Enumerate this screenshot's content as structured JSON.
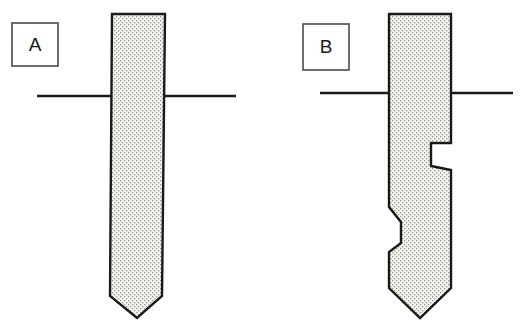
{
  "figure": {
    "background_color": "#ffffff",
    "line_color": "#1a1a1a",
    "fill_color": "#f4f4f0",
    "stipple_dot_color": "#9a9a92",
    "width": 524,
    "height": 324
  },
  "panels": [
    {
      "id": "A",
      "label": "A",
      "label_box": {
        "x": 12,
        "y": 23,
        "width": 46,
        "height": 43
      },
      "description": "Smooth tapered shaft with chamfered tip",
      "ground_line": {
        "x1": 37,
        "x2": 236,
        "y": 96
      },
      "shaft": {
        "top_y": 14,
        "top_left_x": 108,
        "top_right_x": 165,
        "tip_apex_x": 137,
        "tip_apex_y": 318,
        "chamfer_start_y": 296,
        "outline_points": "112,14 165,14 162,296 137,318 110,296"
      }
    },
    {
      "id": "B",
      "label": "B",
      "label_box": {
        "x": 303,
        "y": 24,
        "width": 46,
        "height": 46
      },
      "description": "Stepped shaft with right-side notch and left-side shoulder, chamfered tip",
      "ground_line": {
        "x1": 320,
        "x2": 513,
        "y": 93
      },
      "shaft": {
        "top_y": 14,
        "top_left_x": 389,
        "top_right_x": 451,
        "tip_apex_x": 420,
        "tip_apex_y": 318,
        "chamfer_start_y": 288,
        "right_notch": {
          "inset_x": 431,
          "start_y": 143,
          "end_y": 168
        },
        "left_notch": {
          "outset_x": 401,
          "start_y": 207,
          "flat_top_y": 222,
          "flat_bottom_y": 243,
          "end_y": 252
        },
        "outline_points": "389,14 451,14 451,143 431,143 431,166 451,170 451,288 420,318 389,288 389,252 401,243 401,222 389,207"
      }
    }
  ]
}
